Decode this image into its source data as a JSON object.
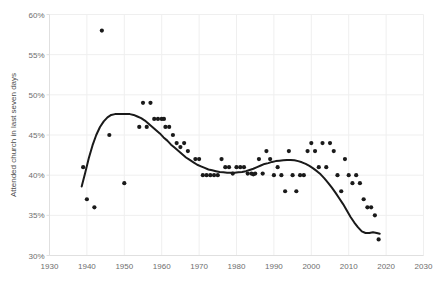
{
  "chart_data": {
    "type": "scatter",
    "title": "",
    "subtitle": "",
    "xlabel": "",
    "ylabel": "Attended church in last seven days",
    "xlim": [
      1930,
      2030
    ],
    "ylim": [
      30,
      60
    ],
    "xticks": [
      1930,
      1940,
      1950,
      1960,
      1970,
      1980,
      1990,
      2000,
      2010,
      2020,
      2030
    ],
    "xtick_labels": [
      "1930",
      "1940",
      "1950",
      "1960",
      "1970",
      "1980",
      "1990",
      "2000",
      "2010",
      "2020",
      "2030"
    ],
    "yticks": [
      30,
      35,
      40,
      45,
      50,
      55,
      60
    ],
    "ytick_labels": [
      "30%",
      "35%",
      "40%",
      "45%",
      "50%",
      "55%",
      "60%"
    ],
    "grid": true,
    "legend": null,
    "legend_position": "none",
    "marker_color": "#1a1a1a",
    "marker_size": 2.1,
    "trend_color": "#1a1a1a",
    "trend_width": 2.0,
    "grid_color": "#efefef",
    "axis_color": "#e0e0e0",
    "background_color": "#ffffff",
    "series": [
      {
        "name": "Attended church in last seven days",
        "type": "scatter",
        "x": [
          1939,
          1940,
          1942,
          1944,
          1946,
          1950,
          1954,
          1955,
          1956,
          1957,
          1958,
          1959,
          1960,
          1960.6,
          1961,
          1962,
          1963,
          1964,
          1965,
          1966,
          1967,
          1969,
          1970,
          1971,
          1972,
          1973,
          1974,
          1975,
          1976,
          1977,
          1978,
          1979,
          1980,
          1981,
          1982,
          1983,
          1984,
          1984.5,
          1985,
          1986,
          1987,
          1988,
          1989,
          1990,
          1991,
          1992,
          1993,
          1994,
          1995,
          1996,
          1997,
          1998,
          1999,
          2000,
          2001,
          2002,
          2003,
          2004,
          2005,
          2006,
          2007,
          2008,
          2009,
          2010,
          2011,
          2012,
          2013,
          2014,
          2015,
          2016,
          2017,
          2018
        ],
        "y": [
          41,
          37,
          36,
          58,
          45,
          39,
          46,
          49,
          46,
          49,
          47,
          47,
          47,
          47,
          46,
          46,
          45,
          44,
          43.5,
          44,
          43,
          42,
          42,
          40,
          40,
          40,
          40,
          40,
          42,
          41,
          41,
          40.2,
          41,
          41,
          41,
          40.2,
          40.2,
          40.1,
          40.2,
          42,
          40.2,
          43,
          42,
          40,
          41,
          40,
          38,
          43,
          40,
          38,
          40,
          40,
          43,
          44,
          43,
          41,
          44,
          41,
          44,
          43,
          40,
          38,
          42,
          40,
          39,
          40,
          39,
          37,
          36,
          36,
          35,
          32
        ]
      }
    ],
    "trend_line": {
      "name": "smoothed trend",
      "type": "line",
      "x": [
        1938.6,
        1939.5,
        1940.5,
        1941.5,
        1942.5,
        1943.5,
        1944.5,
        1945.5,
        1946.5,
        1947.5,
        1948.5,
        1949.5,
        1950.5,
        1951.5,
        1952.5,
        1953.5,
        1954.5,
        1955.5,
        1956.5,
        1957.5,
        1958.5,
        1959.5,
        1960.5,
        1961.5,
        1962.5,
        1963.5,
        1964.5,
        1965.5,
        1966.5,
        1967.5,
        1968.5,
        1969.5,
        1970.5,
        1971.5,
        1972.5,
        1973.5,
        1974.5,
        1975.5,
        1976.5,
        1977.5,
        1978.5,
        1979.5,
        1980.5,
        1981.5,
        1982.5,
        1983.5,
        1984.5,
        1985.5,
        1986.5,
        1987.5,
        1988.5,
        1989.5,
        1990.5,
        1991.5,
        1992.5,
        1993.5,
        1994.5,
        1995.5,
        1996.5,
        1997.5,
        1998.5,
        1999.5,
        2000.5,
        2001.5,
        2002.5,
        2003.5,
        2004.5,
        2005.5,
        2006.5,
        2007.5,
        2008.5,
        2009.5,
        2010.5,
        2011.5,
        2012.5,
        2013.5,
        2014.5,
        2015.5,
        2016.5,
        2017.5,
        2018.3
      ],
      "y": [
        38.6,
        40.2,
        42.1,
        43.7,
        45.0,
        46.0,
        46.7,
        47.2,
        47.5,
        47.6,
        47.6,
        47.6,
        47.6,
        47.6,
        47.5,
        47.3,
        47.1,
        46.8,
        46.4,
        46.0,
        45.6,
        45.2,
        44.7,
        44.3,
        43.8,
        43.4,
        43.0,
        42.6,
        42.2,
        41.9,
        41.6,
        41.3,
        41.1,
        40.9,
        40.7,
        40.6,
        40.5,
        40.4,
        40.35,
        40.3,
        40.3,
        40.3,
        40.35,
        40.4,
        40.5,
        40.65,
        40.8,
        41.0,
        41.2,
        41.4,
        41.5,
        41.65,
        41.75,
        41.8,
        41.85,
        41.9,
        41.9,
        41.85,
        41.75,
        41.6,
        41.4,
        41.15,
        40.85,
        40.5,
        40.1,
        39.6,
        39.05,
        38.45,
        37.8,
        37.1,
        36.4,
        35.6,
        34.8,
        34.1,
        33.5,
        33.0,
        32.8,
        32.8,
        32.9,
        32.8,
        32.7
      ]
    }
  },
  "axes": {
    "y_axis_title": "Attended church in last seven days"
  }
}
